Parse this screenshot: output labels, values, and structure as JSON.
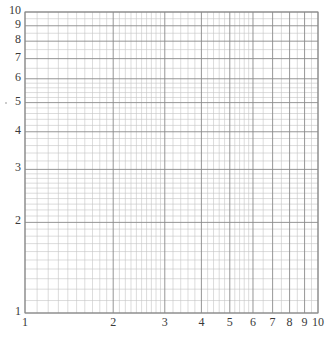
{
  "chart_data": {
    "type": "log-log grid",
    "title": "",
    "xlabel": "",
    "ylabel": "",
    "xscale": "log",
    "yscale": "log",
    "xlim": [
      1,
      10
    ],
    "ylim": [
      1,
      10
    ],
    "x_tick_labels": [
      "1",
      "2",
      "3",
      "4",
      "5",
      "6",
      "7",
      "8",
      "9",
      "10"
    ],
    "y_tick_labels": [
      "1",
      "2",
      "3",
      "4",
      "5",
      "6",
      "7",
      "8",
      "9",
      "10"
    ],
    "grid": true,
    "major_lines": [
      1,
      2,
      3,
      4,
      5,
      6,
      7,
      8,
      9,
      10
    ],
    "minor_subdivisions": {
      "1-2": 10,
      "2-3": 10,
      "3-4": 5,
      "4-5": 5,
      "5-6": 5,
      "6-7": 2,
      "7-8": 2,
      "8-9": 2,
      "9-10": 2
    },
    "series": []
  },
  "colors": {
    "major_line": "#8a8a8a",
    "minor_line": "#c4c4c4",
    "label": "#3a3a3a",
    "background": "#ffffff"
  }
}
